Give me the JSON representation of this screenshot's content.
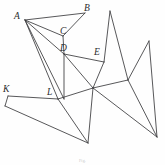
{
  "figure": {
    "background_color": "#fefefe",
    "stroke_color": "#3a3a3c",
    "label_color": "#2b2b2d",
    "caption": "Fig."
  },
  "labels": [
    {
      "id": "A",
      "text": "A",
      "x": 14,
      "y": 12
    },
    {
      "id": "B",
      "text": "B",
      "x": 84,
      "y": 4
    },
    {
      "id": "C",
      "text": "C",
      "x": 60,
      "y": 27
    },
    {
      "id": "D",
      "text": "D",
      "x": 60,
      "y": 44
    },
    {
      "id": "E",
      "text": "E",
      "x": 94,
      "y": 48
    },
    {
      "id": "K",
      "text": "K",
      "x": 3,
      "y": 85
    },
    {
      "id": "L",
      "text": "L",
      "x": 47,
      "y": 88
    }
  ],
  "vertices": [
    {
      "id": "A",
      "label": "A",
      "x": 25,
      "y": 20
    },
    {
      "id": "B",
      "label": "B",
      "x": 85,
      "y": 13
    },
    {
      "id": "C",
      "label": "C",
      "x": 63,
      "y": 36
    },
    {
      "id": "D",
      "label": "D",
      "x": 64,
      "y": 54
    },
    {
      "id": "E",
      "label": "E",
      "x": 104,
      "y": 62
    },
    {
      "id": "K",
      "label": "K",
      "x": 8,
      "y": 96
    },
    {
      "id": "L",
      "label": "L",
      "x": 58,
      "y": 99
    },
    {
      "id": "P1",
      "label": "",
      "x": 110,
      "y": 11
    },
    {
      "id": "P2",
      "label": "",
      "x": 149,
      "y": 41
    },
    {
      "id": "H",
      "label": "",
      "x": 93,
      "y": 88
    },
    {
      "id": "R",
      "label": "",
      "x": 128,
      "y": 80
    },
    {
      "id": "Bt",
      "label": "",
      "x": 88,
      "y": 143
    },
    {
      "id": "BR",
      "label": "",
      "x": 157,
      "y": 137
    },
    {
      "id": "BL",
      "label": "",
      "x": 5,
      "y": 106
    },
    {
      "id": "M",
      "label": "",
      "x": 64,
      "y": 99
    }
  ],
  "edges": [
    {
      "from": "A",
      "to": "B"
    },
    {
      "from": "A",
      "to": "C"
    },
    {
      "from": "A",
      "to": "D"
    },
    {
      "from": "A",
      "to": "L"
    },
    {
      "from": "A",
      "to": "M"
    },
    {
      "from": "B",
      "to": "C"
    },
    {
      "from": "C",
      "to": "D"
    },
    {
      "from": "D",
      "to": "E"
    },
    {
      "from": "D",
      "to": "M"
    },
    {
      "from": "D",
      "to": "H"
    },
    {
      "from": "E",
      "to": "H"
    },
    {
      "from": "E",
      "to": "P1"
    },
    {
      "from": "P1",
      "to": "R"
    },
    {
      "from": "P2",
      "to": "R"
    },
    {
      "from": "P2",
      "to": "BR"
    },
    {
      "from": "R",
      "to": "H"
    },
    {
      "from": "R",
      "to": "BR"
    },
    {
      "from": "H",
      "to": "L"
    },
    {
      "from": "H",
      "to": "Bt"
    },
    {
      "from": "H",
      "to": "BR"
    },
    {
      "from": "K",
      "to": "L"
    },
    {
      "from": "K",
      "to": "BL"
    },
    {
      "from": "L",
      "to": "Bt"
    },
    {
      "from": "BL",
      "to": "Bt"
    }
  ],
  "edge_count": 24,
  "vertex_count": 15,
  "labeled_vertex_count": 7
}
